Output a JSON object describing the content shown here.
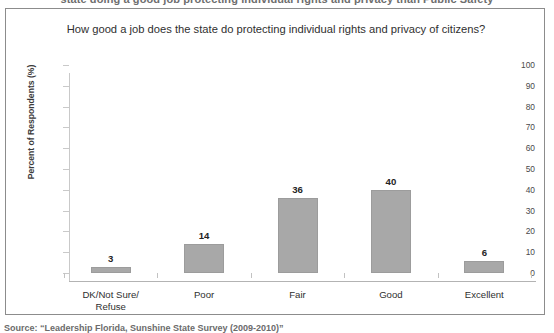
{
  "top_caption": "state doing a good job protecting individual rights and privacy than Public Safety",
  "source_note": "Source: “Leadership Florida, Sunshine State Survey (2009-2010)”",
  "chart_data": {
    "type": "bar",
    "title": "How good a job does the state do protecting individual rights and privacy of citizens?",
    "xlabel": "",
    "ylabel": "Percent of Respondents (%)",
    "categories": [
      "DK/Not Sure/\nRefuse",
      "Poor",
      "Fair",
      "Good",
      "Excellent"
    ],
    "category_lines": [
      [
        "DK/Not Sure/",
        "Refuse"
      ],
      [
        "Poor"
      ],
      [
        "Fair"
      ],
      [
        "Good"
      ],
      [
        "Excellent"
      ]
    ],
    "values": [
      3,
      14,
      36,
      40,
      6
    ],
    "value_labels": [
      "3",
      "14",
      "36",
      "40",
      "6"
    ],
    "ylim": [
      0,
      100
    ],
    "yticks": [
      0,
      10,
      20,
      30,
      40,
      50,
      60,
      70,
      80,
      90,
      100
    ],
    "ytick_labels": [
      "0",
      "10",
      "20",
      "30",
      "40",
      "50",
      "60",
      "70",
      "80",
      "90",
      "100"
    ],
    "grid": false,
    "legend": false,
    "bar_color": "#a8a8a8",
    "axis_color": "#c2c2c2",
    "frame_color": "#8c8c8c"
  }
}
